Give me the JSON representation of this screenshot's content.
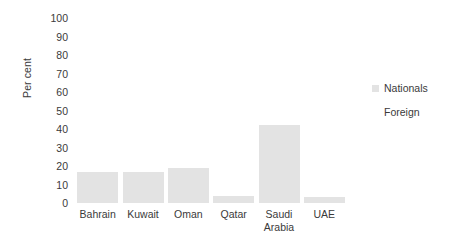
{
  "chart_data": {
    "type": "bar",
    "title": "",
    "xlabel": "",
    "ylabel": "Per cent",
    "ylim": [
      0,
      100
    ],
    "ytick_step": 10,
    "yticks": [
      "100",
      "90",
      "80",
      "70",
      "60",
      "50",
      "40",
      "30",
      "20",
      "10",
      "0"
    ],
    "grid": false,
    "legend_position": "right",
    "categories": [
      "Bahrain",
      "Kuwait",
      "Oman",
      "Qatar",
      "Saudi Arabia",
      "UAE"
    ],
    "category_lines": [
      [
        "Bahrain"
      ],
      [
        "Kuwait"
      ],
      [
        "Oman"
      ],
      [
        "Qatar"
      ],
      [
        "Saudi",
        "Arabia"
      ],
      [
        "UAE"
      ]
    ],
    "series": [
      {
        "name": "Nationals",
        "color": "#e3e3e3",
        "values": [
          17,
          17,
          19,
          4,
          42,
          3
        ]
      },
      {
        "name": "Foreign",
        "color": "#ffffff",
        "values": [
          0,
          0,
          0,
          0,
          0,
          0
        ]
      }
    ]
  },
  "legend": {
    "entries": [
      {
        "label": "Nationals",
        "color": "#e3e3e3"
      },
      {
        "label": "Foreign",
        "color": "#ffffff"
      }
    ]
  },
  "colors": {
    "background": "#ffffff",
    "text": "#3a3a3a",
    "bar_nationals": "#e3e3e3",
    "bar_foreign": "#ffffff"
  }
}
